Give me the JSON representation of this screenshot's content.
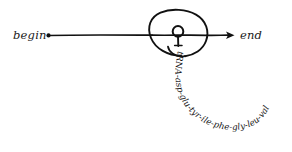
{
  "diagram": {
    "title_visible": false,
    "background_color": "#ffffff",
    "ink_color": "#111111",
    "style": "hand-drawn pen sketch",
    "labels": {
      "begin": "begin",
      "end": "end"
    },
    "strand": {
      "name": "mRNA strand",
      "start_marker": "dot",
      "end_marker": "arrowhead",
      "direction": "left-to-right"
    },
    "ribosome": {
      "name": "ribosome",
      "shape": "open spiral circle"
    },
    "trna": {
      "name": "tRNA",
      "shape": "small circle with stem"
    },
    "peptide_chain": {
      "full_text": "tRNA-asp-glu-tyr-ile-phe-gly-leu-val",
      "residues": [
        "tRNA",
        "asp",
        "glu",
        "tyr",
        "ile",
        "phe",
        "gly",
        "leu",
        "val"
      ],
      "separator": "-",
      "path": "curves down from ribosome then arcs right and upward"
    }
  }
}
